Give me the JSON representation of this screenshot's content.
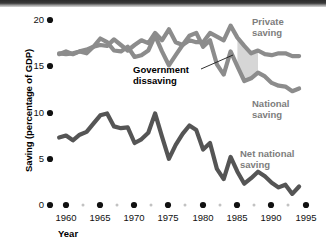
{
  "chart_data": {
    "type": "line",
    "title": "",
    "xlabel": "Year",
    "ylabel": "Saving (percentage of GDP)",
    "xlim": [
      1959,
      1995
    ],
    "ylim": [
      0,
      20
    ],
    "yticks": [
      0,
      5,
      10,
      15,
      20
    ],
    "xticks": [
      1960,
      1965,
      1970,
      1975,
      1980,
      1985,
      1990,
      1995
    ],
    "grid": false,
    "legend_position": "inline-annotations",
    "annotations": [
      {
        "text": "Government dissaving",
        "kind": "gap-between-private-and-national",
        "color": "#000000"
      }
    ],
    "series": [
      {
        "name": "Private saving",
        "color": "#8c8c8c",
        "x": [
          1959,
          1960,
          1961,
          1962,
          1963,
          1964,
          1965,
          1966,
          1967,
          1968,
          1969,
          1970,
          1971,
          1972,
          1973,
          1974,
          1975,
          1976,
          1977,
          1978,
          1979,
          1980,
          1981,
          1982,
          1983,
          1984,
          1985,
          1986,
          1987,
          1988,
          1989,
          1990,
          1991,
          1992,
          1993,
          1994
        ],
        "values": [
          16.4,
          16.3,
          16.4,
          16.6,
          16.4,
          17.1,
          17.3,
          17.2,
          17.9,
          17.3,
          16.7,
          17.3,
          17.8,
          17.5,
          18.6,
          17.8,
          19.0,
          17.6,
          17.3,
          17.8,
          17.6,
          17.6,
          18.6,
          18.2,
          17.8,
          19.4,
          18.1,
          17.2,
          16.4,
          16.7,
          16.3,
          16.2,
          16.4,
          16.4,
          16.1,
          16.1
        ]
      },
      {
        "name": "National saving",
        "color": "#8c8c8c",
        "x": [
          1959,
          1960,
          1961,
          1962,
          1963,
          1964,
          1965,
          1966,
          1967,
          1968,
          1969,
          1970,
          1971,
          1972,
          1973,
          1974,
          1975,
          1976,
          1977,
          1978,
          1979,
          1980,
          1981,
          1982,
          1983,
          1984,
          1985,
          1986,
          1987,
          1988,
          1989,
          1990,
          1991,
          1992,
          1993,
          1994
        ],
        "values": [
          16.3,
          16.6,
          16.3,
          16.6,
          16.8,
          17.1,
          18.0,
          17.6,
          16.7,
          16.6,
          17.1,
          16.0,
          16.2,
          16.7,
          18.3,
          16.6,
          15.1,
          16.2,
          17.3,
          18.3,
          18.6,
          17.1,
          17.8,
          15.2,
          14.1,
          16.6,
          15.0,
          13.4,
          13.7,
          14.3,
          13.9,
          13.2,
          12.9,
          12.8,
          12.3,
          12.6
        ]
      },
      {
        "name": "Net national saving",
        "color": "#555555",
        "x": [
          1959,
          1960,
          1961,
          1962,
          1963,
          1964,
          1965,
          1966,
          1967,
          1968,
          1969,
          1970,
          1971,
          1972,
          1973,
          1974,
          1975,
          1976,
          1977,
          1978,
          1979,
          1980,
          1981,
          1982,
          1983,
          1984,
          1985,
          1986,
          1987,
          1988,
          1989,
          1990,
          1991,
          1992,
          1993,
          1994
        ],
        "values": [
          7.3,
          7.5,
          7.0,
          7.6,
          7.9,
          8.8,
          9.7,
          9.9,
          8.5,
          8.3,
          8.4,
          6.7,
          7.1,
          7.8,
          9.9,
          7.4,
          5.0,
          6.5,
          7.7,
          8.6,
          8.1,
          6.0,
          6.7,
          3.9,
          2.8,
          5.2,
          3.6,
          2.3,
          2.9,
          3.6,
          3.1,
          2.4,
          1.9,
          2.2,
          1.2,
          2.0
        ]
      }
    ]
  },
  "axis": {
    "y_title": "Saving (percentage of GDP)",
    "x_title": "Year",
    "y_tick_labels": [
      "20",
      "15",
      "10",
      "5",
      "0"
    ],
    "x_tick_labels": [
      "1960",
      "1965",
      "1970",
      "1975",
      "1980",
      "1985",
      "1990",
      "1995"
    ]
  },
  "labels": {
    "private_saving": "Private\nsaving",
    "private_saving_line1": "Private",
    "private_saving_line2": "saving",
    "national_saving_line1": "National",
    "national_saving_line2": "saving",
    "net_national_saving_line1": "Net national",
    "net_national_saving_line2": "saving",
    "government_line1": "Government",
    "government_line2": "dissaving"
  },
  "colors": {
    "series_gray": "#8c8c8c",
    "series_dark": "#555555",
    "gap_fill": "#cfcfcf",
    "label_gray": "#7d7d7d",
    "text_black": "#000000",
    "tick_dot_black": "#111111",
    "tick_dot_gray": "#bdbdbd"
  }
}
